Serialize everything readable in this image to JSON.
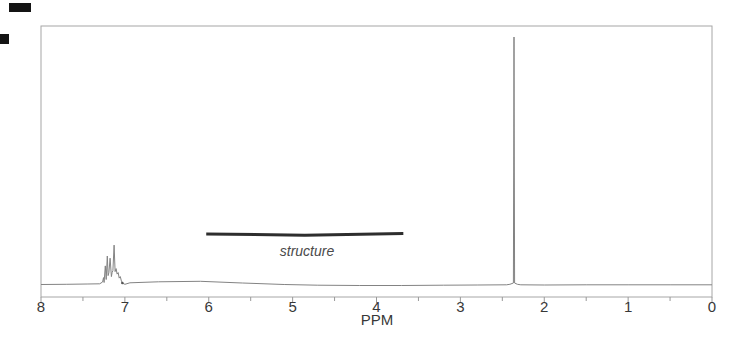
{
  "figure": {
    "xlabel": "PPM",
    "structure_label": "structure",
    "axis": {
      "min": 0,
      "max": 8,
      "major_step": 1,
      "minor_step": 0.5,
      "tick_labels": [
        "8",
        "7",
        "6",
        "5",
        "4",
        "3",
        "2",
        "1",
        "0"
      ]
    },
    "colors": {
      "trace": "#838383",
      "frame": "#a6a6a6",
      "tick": "#999999",
      "text": "#383838",
      "bar": "#2e2e2e",
      "dot": "#555555"
    },
    "chart_data": {
      "type": "line",
      "xlabel": "PPM",
      "x_range": [
        8,
        0
      ],
      "ylim": [
        0,
        1
      ],
      "grid": false,
      "peaks": [
        {
          "ppm": 7.13,
          "shape": "multiplet",
          "relative_height": 0.16,
          "span_ppm": [
            7.27,
            7.0
          ]
        },
        {
          "ppm": 2.36,
          "shape": "singlet",
          "relative_height": 1.0
        }
      ],
      "structure_bar": {
        "from_ppm": 6.03,
        "to_ppm": 3.68
      },
      "artifact_dot": {
        "ppm": 7.03
      },
      "trace": [
        [
          8.0,
          0.002
        ],
        [
          7.7,
          0.003
        ],
        [
          7.45,
          0.004
        ],
        [
          7.3,
          0.005
        ],
        [
          7.265,
          0.012
        ],
        [
          7.255,
          0.03
        ],
        [
          7.248,
          0.01
        ],
        [
          7.233,
          0.077
        ],
        [
          7.223,
          0.022
        ],
        [
          7.21,
          0.117
        ],
        [
          7.2,
          0.038
        ],
        [
          7.191,
          0.05
        ],
        [
          7.176,
          0.108
        ],
        [
          7.161,
          0.034
        ],
        [
          7.152,
          0.05
        ],
        [
          7.143,
          0.058
        ],
        [
          7.128,
          0.161
        ],
        [
          7.116,
          0.054
        ],
        [
          7.105,
          0.066
        ],
        [
          7.093,
          0.044
        ],
        [
          7.08,
          0.05
        ],
        [
          7.068,
          0.028
        ],
        [
          7.054,
          0.034
        ],
        [
          7.042,
          0.016
        ],
        [
          7.025,
          0.007
        ],
        [
          7.0,
          0.003
        ],
        [
          6.94,
          0.009
        ],
        [
          6.6,
          0.013
        ],
        [
          6.1,
          0.015
        ],
        [
          5.6,
          0.008
        ],
        [
          5.1,
          0.002
        ],
        [
          4.7,
          -0.001
        ],
        [
          4.2,
          -0.002
        ],
        [
          3.7,
          -0.002
        ],
        [
          3.2,
          -0.001
        ],
        [
          2.8,
          0.0
        ],
        [
          2.45,
          0.001
        ],
        [
          2.41,
          0.003
        ],
        [
          2.368,
          0.008
        ],
        [
          2.361,
          1.0
        ],
        [
          2.354,
          0.008
        ],
        [
          2.32,
          0.003
        ],
        [
          2.28,
          0.001
        ],
        [
          2.0,
          0.0
        ],
        [
          1.5,
          0.001
        ],
        [
          1.0,
          0.001
        ],
        [
          0.5,
          0.001
        ],
        [
          0.0,
          0.001
        ]
      ]
    }
  }
}
